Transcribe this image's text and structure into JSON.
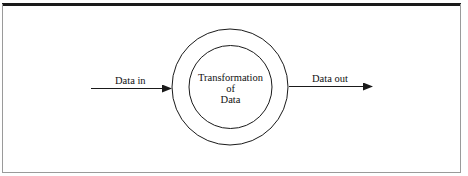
{
  "diagram": {
    "type": "data-flow-process",
    "process": {
      "label_lines": [
        "Transformation",
        "of",
        "Data"
      ],
      "shape": "double-circle"
    },
    "flows": [
      {
        "label": "Data in",
        "direction": "into-process"
      },
      {
        "label": "Data out",
        "direction": "out-of-process"
      }
    ]
  },
  "colors": {
    "stroke": "#1a1a1a",
    "frame": "#9a9a9a",
    "background": "#ffffff"
  }
}
